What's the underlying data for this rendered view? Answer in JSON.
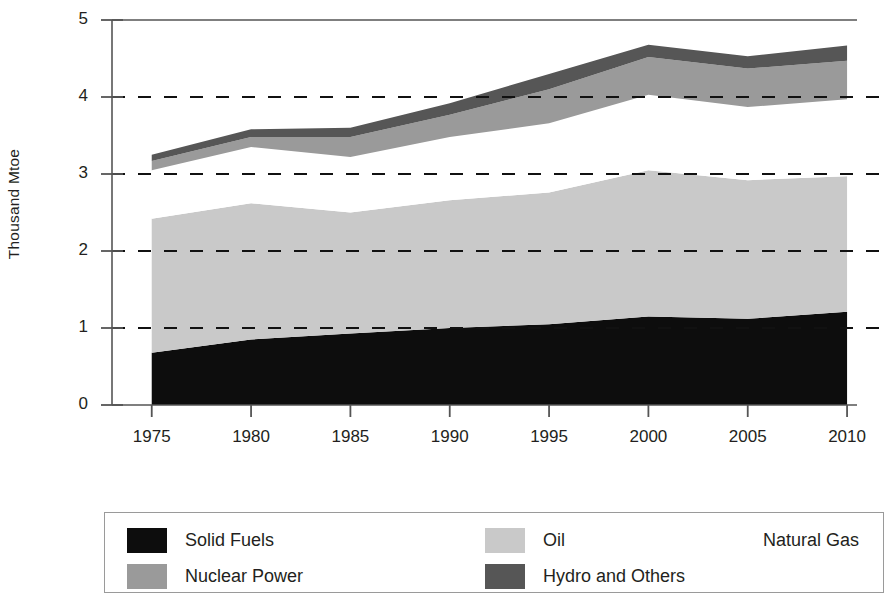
{
  "chart_data": {
    "type": "area",
    "stacked": true,
    "title": "",
    "subtitle": "",
    "xlabel": "",
    "ylabel": "Thousand Mtoe",
    "x": [
      1975,
      1980,
      1985,
      1990,
      1995,
      2000,
      2005,
      2010
    ],
    "categories": [
      "1975",
      "1980",
      "1985",
      "1990",
      "1995",
      "2000",
      "2005",
      "2010"
    ],
    "xlim": [
      1973,
      2010.5
    ],
    "ylim": [
      0,
      5
    ],
    "ytick_labels": [
      "0",
      "1",
      "2",
      "3",
      "4",
      "5"
    ],
    "ytick_values": [
      0,
      1,
      2,
      3,
      4,
      5
    ],
    "xtick_labels": [
      "1975",
      "1980",
      "1985",
      "1990",
      "1995",
      "2000",
      "2005",
      "2010"
    ],
    "grid": "horizontal-dashed",
    "gridline_values": [
      1,
      2,
      3,
      4
    ],
    "legend_position": "below-boxed",
    "series": [
      {
        "name": "Solid Fuels",
        "color": "#0d0d0d",
        "values": [
          0.68,
          0.85,
          0.93,
          1.0,
          1.05,
          1.15,
          1.12,
          1.21
        ]
      },
      {
        "name": "Oil",
        "color": "#c9c9c9",
        "values": [
          1.74,
          1.77,
          1.57,
          1.66,
          1.71,
          1.9,
          1.8,
          1.76
        ]
      },
      {
        "name": "Natural Gas",
        "color": "#ffffff",
        "values": [
          0.63,
          0.73,
          0.72,
          0.82,
          0.9,
          0.98,
          0.95,
          1.0
        ]
      },
      {
        "name": "Nuclear Power",
        "color": "#9a9a9a",
        "values": [
          0.12,
          0.13,
          0.26,
          0.29,
          0.44,
          0.49,
          0.5,
          0.5
        ]
      },
      {
        "name": "Hydro and Others",
        "color": "#565656",
        "values": [
          0.08,
          0.1,
          0.12,
          0.15,
          0.2,
          0.16,
          0.16,
          0.2
        ]
      }
    ],
    "cumulative_tops": [
      {
        "year": "1975",
        "solid_fuels": 0.68,
        "oil": 2.42,
        "natural_gas": 3.05,
        "nuclear_power": 3.17,
        "hydro_and_others": 3.25
      },
      {
        "year": "1980",
        "solid_fuels": 0.85,
        "oil": 2.62,
        "natural_gas": 3.35,
        "nuclear_power": 3.48,
        "hydro_and_others": 3.58
      },
      {
        "year": "1985",
        "solid_fuels": 0.93,
        "oil": 2.5,
        "natural_gas": 3.22,
        "nuclear_power": 3.48,
        "hydro_and_others": 3.6
      },
      {
        "year": "1990",
        "solid_fuels": 1.0,
        "oil": 2.66,
        "natural_gas": 3.48,
        "nuclear_power": 3.77,
        "hydro_and_others": 3.92
      },
      {
        "year": "1995",
        "solid_fuels": 1.05,
        "oil": 2.76,
        "natural_gas": 3.66,
        "nuclear_power": 4.1,
        "hydro_and_others": 4.3
      },
      {
        "year": "2000",
        "solid_fuels": 1.15,
        "oil": 3.05,
        "natural_gas": 4.03,
        "nuclear_power": 4.52,
        "hydro_and_others": 4.68
      },
      {
        "year": "2005",
        "solid_fuels": 1.12,
        "oil": 2.92,
        "natural_gas": 3.87,
        "nuclear_power": 4.37,
        "hydro_and_others": 4.53
      },
      {
        "year": "2010",
        "solid_fuels": 1.21,
        "oil": 2.97,
        "natural_gas": 3.97,
        "nuclear_power": 4.47,
        "hydro_and_others": 4.67
      }
    ]
  },
  "axes": {
    "y_title": "Thousand Mtoe",
    "y_ticks": [
      {
        "label": "5",
        "value": 5
      },
      {
        "label": "4",
        "value": 4
      },
      {
        "label": "3",
        "value": 3
      },
      {
        "label": "2",
        "value": 2
      },
      {
        "label": "1",
        "value": 1
      },
      {
        "label": "0",
        "value": 0
      }
    ],
    "x_ticks": [
      {
        "label": "1975",
        "value": 1975
      },
      {
        "label": "1980",
        "value": 1980
      },
      {
        "label": "1985",
        "value": 1985
      },
      {
        "label": "1990",
        "value": 1990
      },
      {
        "label": "1995",
        "value": 1995
      },
      {
        "label": "2000",
        "value": 2000
      },
      {
        "label": "2005",
        "value": 2005
      },
      {
        "label": "2010",
        "value": 2010
      }
    ]
  },
  "legend": {
    "entries": [
      {
        "label": "Solid Fuels",
        "color": "#0d0d0d",
        "row": 0,
        "col": 0
      },
      {
        "label": "Oil",
        "color": "#c9c9c9",
        "row": 0,
        "col": 1
      },
      {
        "label": "Natural Gas",
        "color": "#ffffff",
        "row": 0,
        "col": 2
      },
      {
        "label": "Nuclear Power",
        "color": "#9a9a9a",
        "row": 1,
        "col": 0
      },
      {
        "label": "Hydro and Others",
        "color": "#565656",
        "row": 1,
        "col": 1
      }
    ]
  },
  "colors": {
    "axis": "#555555",
    "gridline": "#111111",
    "text": "#231f20",
    "legend_border": "#9a9a9a"
  }
}
